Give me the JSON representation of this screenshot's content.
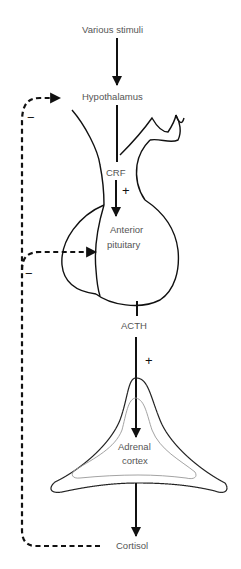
{
  "diagram": {
    "type": "hormone-feedback-loop",
    "nodes": {
      "stimuli": "Various stimuli",
      "hypothalamus": "Hypothalamus",
      "crf": "CRF",
      "anterior_pituitary_line1": "Anterior",
      "anterior_pituitary_line2": "pituitary",
      "acth": "ACTH",
      "adrenal_line1": "Adrenal",
      "adrenal_line2": "cortex",
      "cortisol": "Cortisol"
    },
    "signs": {
      "crf_to_pituitary": "+",
      "acth_to_adrenal": "+",
      "feedback_hypothalamus": "−",
      "feedback_pituitary": "−"
    },
    "colors": {
      "line": "#111111",
      "label": "#555555",
      "inner_outline": "#999999"
    }
  }
}
